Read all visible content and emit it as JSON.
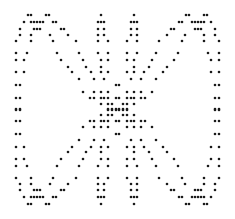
{
  "figure": {
    "width": 235,
    "height": 219,
    "dot_color": "#1a1a1a",
    "background": "#ffffff",
    "dot_radius": 1.3,
    "mirror_center": [
      117.5,
      109.5
    ],
    "quadrant_dots": [
      [
        28,
        15
      ],
      [
        31,
        15
      ],
      [
        46,
        15
      ],
      [
        49,
        15
      ],
      [
        101,
        15
      ],
      [
        24,
        22
      ],
      [
        31,
        22
      ],
      [
        34,
        22
      ],
      [
        37,
        22
      ],
      [
        40,
        22
      ],
      [
        43,
        22
      ],
      [
        53,
        22
      ],
      [
        56,
        22
      ],
      [
        98,
        22
      ],
      [
        101,
        22
      ],
      [
        104,
        22
      ],
      [
        20,
        29
      ],
      [
        34,
        29
      ],
      [
        37,
        29
      ],
      [
        40,
        29
      ],
      [
        61,
        29
      ],
      [
        64,
        29
      ],
      [
        98,
        29
      ],
      [
        104,
        29
      ],
      [
        20,
        35
      ],
      [
        31,
        35
      ],
      [
        50,
        35
      ],
      [
        68,
        35
      ],
      [
        98,
        35
      ],
      [
        104,
        35
      ],
      [
        16,
        41
      ],
      [
        31,
        41
      ],
      [
        53,
        41
      ],
      [
        76,
        41
      ],
      [
        98,
        41
      ],
      [
        108,
        41
      ],
      [
        16,
        53
      ],
      [
        27,
        53
      ],
      [
        57,
        53
      ],
      [
        79,
        53
      ],
      [
        98,
        53
      ],
      [
        108,
        53
      ],
      [
        16,
        60
      ],
      [
        24,
        60
      ],
      [
        61,
        60
      ],
      [
        83,
        60
      ],
      [
        101,
        60
      ],
      [
        108,
        60
      ],
      [
        68,
        67
      ],
      [
        86,
        67
      ],
      [
        101,
        67
      ],
      [
        16,
        72
      ],
      [
        24,
        72
      ],
      [
        72,
        72
      ],
      [
        91,
        72
      ],
      [
        101,
        72
      ],
      [
        108,
        72
      ],
      [
        79,
        79
      ],
      [
        94,
        79
      ],
      [
        104,
        79
      ],
      [
        16,
        85
      ],
      [
        20,
        85
      ],
      [
        116,
        85
      ],
      [
        83,
        92
      ],
      [
        94,
        92
      ],
      [
        101,
        92
      ],
      [
        108,
        92
      ],
      [
        16,
        98
      ],
      [
        20,
        98
      ],
      [
        90,
        98
      ],
      [
        94,
        98
      ],
      [
        101,
        98
      ],
      [
        104,
        98
      ],
      [
        108,
        98
      ],
      [
        116,
        98
      ],
      [
        101,
        104
      ],
      [
        108,
        104
      ],
      [
        112,
        104
      ],
      [
        108,
        109
      ],
      [
        112,
        109
      ],
      [
        116,
        109
      ],
      [
        16,
        109
      ],
      [
        20,
        109
      ]
    ]
  }
}
